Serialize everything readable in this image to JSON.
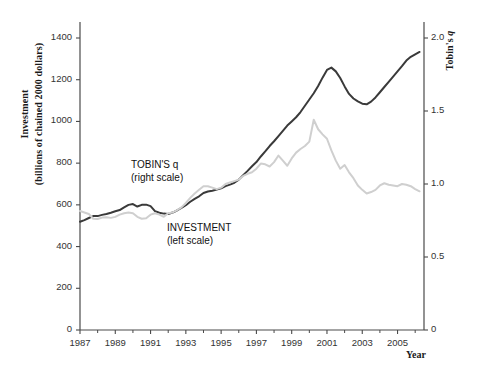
{
  "chart_data": {
    "type": "line",
    "title": "",
    "xlabel": "Year",
    "ylabel_left": "Investment\n(billions of chained 2000 dollars)",
    "ylabel_left_line1": "Investment",
    "ylabel_left_line2": "(billions of chained 2000 dollars)",
    "ylabel_right": "Tobin's q",
    "ylabel_right_prefix": "Tobin's ",
    "ylabel_right_italic": "q",
    "xlim": [
      1987,
      2006.5
    ],
    "ylim_left": [
      0,
      1400
    ],
    "ylim_right": [
      0,
      2.0
    ],
    "grid": false,
    "legend_position": "inline-annotations",
    "yticks_left": [
      "0",
      "200",
      "400",
      "600",
      "800",
      "1000",
      "1200",
      "1400"
    ],
    "yticks_left_values": [
      0,
      200,
      400,
      600,
      800,
      1000,
      1200,
      1400
    ],
    "yticks_right": [
      "0",
      "0.5",
      "1.0",
      "1.5",
      "2.0"
    ],
    "yticks_right_values": [
      0,
      0.5,
      1.0,
      1.5,
      2.0
    ],
    "xticks": [
      "1987",
      "1989",
      "1991",
      "1993",
      "1995",
      "1997",
      "1999",
      "2001",
      "2003",
      "2005"
    ],
    "xticks_values": [
      1987,
      1989,
      1991,
      1993,
      1995,
      1997,
      1999,
      2001,
      2003,
      2005
    ],
    "xticks_minor_values": [
      1988,
      1990,
      1992,
      1994,
      1996,
      1998,
      2000,
      2002,
      2004,
      2006
    ],
    "annotations": [
      {
        "name": "tobins-q-label",
        "line1": "TOBIN'S q",
        "line2": "(right scale)",
        "italic_token": "q"
      },
      {
        "name": "investment-label",
        "line1": "INVESTMENT",
        "line2": "(left scale)"
      }
    ],
    "series": [
      {
        "name": "INVESTMENT",
        "axis": "left",
        "color": "#3a3a3a",
        "units": "billions of chained 2000 dollars",
        "x": [
          1987.0,
          1987.25,
          1987.5,
          1987.75,
          1988.0,
          1988.25,
          1988.5,
          1988.75,
          1989.0,
          1989.25,
          1989.5,
          1989.75,
          1990.0,
          1990.25,
          1990.5,
          1990.75,
          1991.0,
          1991.25,
          1991.5,
          1991.75,
          1992.0,
          1992.25,
          1992.5,
          1992.75,
          1993.0,
          1993.25,
          1993.5,
          1993.75,
          1994.0,
          1994.25,
          1994.5,
          1994.75,
          1995.0,
          1995.25,
          1995.5,
          1995.75,
          1996.0,
          1996.25,
          1996.5,
          1996.75,
          1997.0,
          1997.25,
          1997.5,
          1997.75,
          1998.0,
          1998.25,
          1998.5,
          1998.75,
          1999.0,
          1999.25,
          1999.5,
          1999.75,
          2000.0,
          2000.25,
          2000.5,
          2000.75,
          2001.0,
          2001.25,
          2001.5,
          2001.75,
          2002.0,
          2002.25,
          2002.5,
          2002.75,
          2003.0,
          2003.25,
          2003.5,
          2003.75,
          2004.0,
          2004.25,
          2004.5,
          2004.75,
          2005.0,
          2005.25,
          2005.5,
          2005.75,
          2006.0,
          2006.25
        ],
        "y": [
          519,
          527,
          537,
          546,
          546,
          552,
          556,
          562,
          569,
          575,
          588,
          600,
          604,
          592,
          600,
          601,
          594,
          570,
          562,
          558,
          556,
          563,
          573,
          585,
          598,
          615,
          629,
          641,
          657,
          664,
          668,
          673,
          679,
          690,
          697,
          706,
          721,
          742,
          763,
          785,
          805,
          832,
          856,
          882,
          905,
          930,
          955,
          980,
          1000,
          1020,
          1045,
          1075,
          1105,
          1135,
          1170,
          1210,
          1247,
          1258,
          1240,
          1208,
          1168,
          1132,
          1110,
          1096,
          1085,
          1082,
          1095,
          1115,
          1140,
          1165,
          1190,
          1215,
          1240,
          1265,
          1292,
          1310,
          1322,
          1333
        ]
      },
      {
        "name": "TOBIN'S q",
        "axis": "right",
        "color": "#cfcfcf",
        "units": "ratio",
        "x": [
          1987.0,
          1987.25,
          1987.5,
          1987.75,
          1988.0,
          1988.25,
          1988.5,
          1988.75,
          1989.0,
          1989.25,
          1989.5,
          1989.75,
          1990.0,
          1990.25,
          1990.5,
          1990.75,
          1991.0,
          1991.25,
          1991.5,
          1991.75,
          1992.0,
          1992.25,
          1992.5,
          1992.75,
          1993.0,
          1993.25,
          1993.5,
          1993.75,
          1994.0,
          1994.25,
          1994.5,
          1994.75,
          1995.0,
          1995.25,
          1995.5,
          1995.75,
          1996.0,
          1996.25,
          1996.5,
          1996.75,
          1997.0,
          1997.25,
          1997.5,
          1997.75,
          1998.0,
          1998.25,
          1998.5,
          1998.75,
          1999.0,
          1999.25,
          1999.5,
          1999.75,
          2000.0,
          2000.25,
          2000.5,
          2000.75,
          2001.0,
          2001.25,
          2001.5,
          2001.75,
          2002.0,
          2002.25,
          2002.5,
          2002.75,
          2003.0,
          2003.25,
          2003.5,
          2003.75,
          2004.0,
          2004.25,
          2004.5,
          2004.75,
          2005.0,
          2005.25,
          2005.5,
          2005.75,
          2006.0,
          2006.25
        ],
        "y": [
          0.815,
          0.805,
          0.795,
          0.762,
          0.76,
          0.77,
          0.772,
          0.768,
          0.775,
          0.79,
          0.8,
          0.805,
          0.8,
          0.775,
          0.762,
          0.765,
          0.79,
          0.8,
          0.79,
          0.775,
          0.8,
          0.805,
          0.82,
          0.84,
          0.87,
          0.905,
          0.935,
          0.96,
          0.985,
          0.985,
          0.975,
          0.965,
          0.975,
          1.0,
          1.01,
          1.02,
          1.03,
          1.055,
          1.07,
          1.08,
          1.105,
          1.14,
          1.135,
          1.12,
          1.15,
          1.195,
          1.16,
          1.125,
          1.175,
          1.215,
          1.24,
          1.26,
          1.29,
          1.44,
          1.375,
          1.34,
          1.31,
          1.23,
          1.16,
          1.105,
          1.13,
          1.08,
          1.04,
          0.99,
          0.96,
          0.935,
          0.945,
          0.96,
          0.99,
          1.005,
          0.995,
          0.99,
          0.985,
          1.0,
          0.995,
          0.985,
          0.965,
          0.95
        ]
      }
    ]
  },
  "axes": {
    "left_axis_name": "left-value-axis",
    "right_axis_name": "right-value-axis",
    "bottom_axis_name": "year-axis"
  }
}
